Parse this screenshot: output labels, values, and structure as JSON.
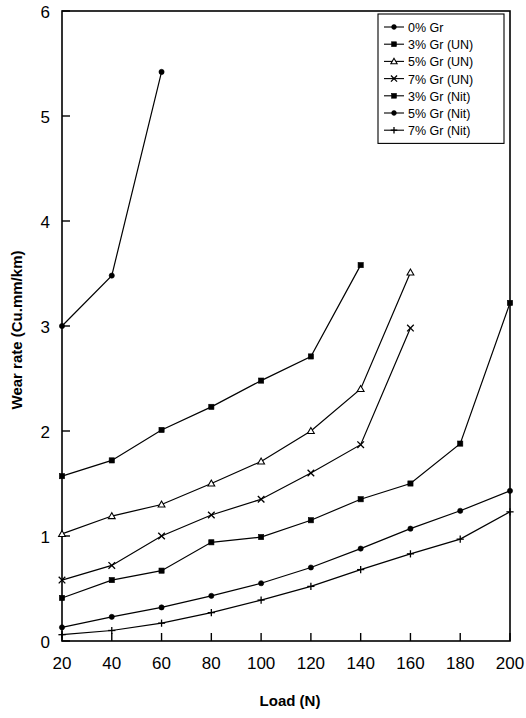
{
  "chart_data": {
    "type": "line",
    "title": "",
    "xlabel": "Load (N)",
    "ylabel": "Wear rate (Cu.mm/km)",
    "xlim": [
      20,
      200
    ],
    "ylim": [
      0,
      6
    ],
    "xticks": [
      20,
      40,
      60,
      80,
      100,
      120,
      140,
      160,
      180,
      200
    ],
    "yticks": [
      0,
      1,
      2,
      3,
      4,
      5,
      6
    ],
    "grid": false,
    "legend_position": "top-right",
    "line_color": "#000000",
    "series": [
      {
        "name": "0% Gr",
        "marker": "filled-circle",
        "x": [
          20,
          40,
          60
        ],
        "values": [
          3.0,
          3.48,
          5.42
        ]
      },
      {
        "name": "3% Gr (UN)",
        "marker": "filled-square",
        "x": [
          20,
          40,
          60,
          80,
          100,
          120,
          140
        ],
        "values": [
          1.57,
          1.72,
          2.01,
          2.23,
          2.48,
          2.71,
          3.58
        ]
      },
      {
        "name": "5% Gr (UN)",
        "marker": "open-triangle",
        "x": [
          20,
          40,
          60,
          80,
          100,
          120,
          140,
          160
        ],
        "values": [
          1.02,
          1.19,
          1.3,
          1.5,
          1.71,
          2.0,
          2.4,
          3.51
        ]
      },
      {
        "name": "7% Gr (UN)",
        "marker": "cross-x",
        "x": [
          20,
          40,
          60,
          80,
          100,
          120,
          140,
          160
        ],
        "values": [
          0.58,
          0.72,
          1.0,
          1.2,
          1.35,
          1.6,
          1.87,
          2.98
        ]
      },
      {
        "name": "3% Gr (Nit)",
        "marker": "filled-square",
        "x": [
          20,
          40,
          60,
          80,
          100,
          120,
          140,
          160,
          180,
          200
        ],
        "values": [
          0.41,
          0.58,
          0.67,
          0.94,
          0.99,
          1.15,
          1.35,
          1.5,
          1.88,
          3.22
        ]
      },
      {
        "name": "5% Gr (Nit)",
        "marker": "filled-circle",
        "x": [
          20,
          40,
          60,
          80,
          100,
          120,
          140,
          160,
          180,
          200
        ],
        "values": [
          0.13,
          0.23,
          0.32,
          0.43,
          0.55,
          0.7,
          0.88,
          1.07,
          1.24,
          1.43
        ]
      },
      {
        "name": "7% Gr (Nit)",
        "marker": "plus",
        "x": [
          20,
          40,
          60,
          80,
          100,
          120,
          140,
          160,
          180,
          200
        ],
        "values": [
          0.06,
          0.1,
          0.17,
          0.27,
          0.39,
          0.52,
          0.68,
          0.83,
          0.97,
          1.23
        ]
      }
    ]
  },
  "legend": {
    "items": [
      {
        "label": "0% Gr"
      },
      {
        "label": "3% Gr (UN)"
      },
      {
        "label": "5% Gr (UN)"
      },
      {
        "label": "7% Gr (UN)"
      },
      {
        "label": "3% Gr (Nit)"
      },
      {
        "label": "5% Gr (Nit)"
      },
      {
        "label": "7% Gr (Nit)"
      }
    ]
  },
  "axes": {
    "x_title": "Load (N)",
    "y_title": "Wear rate (Cu.mm/km)",
    "x_tick_labels": [
      "20",
      "40",
      "60",
      "80",
      "100",
      "120",
      "140",
      "160",
      "180",
      "200"
    ],
    "y_tick_labels": [
      "0",
      "1",
      "2",
      "3",
      "4",
      "5",
      "6"
    ]
  }
}
